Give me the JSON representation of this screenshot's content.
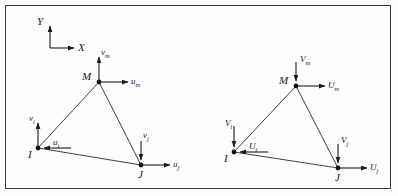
{
  "figure": {
    "border_color": "#3a3a3a",
    "line_color": "#1a1a1a",
    "background": "#fdfdfc"
  },
  "axes": {
    "x_label": "X",
    "y_label": "Y",
    "x_direction": "right",
    "y_direction": "up",
    "origin": [
      50,
      48
    ]
  },
  "elements": [
    {
      "name": "left-element",
      "coordinate_system": "local",
      "nodes": [
        {
          "id": "I",
          "label": "I",
          "x": 38,
          "y": 148
        },
        {
          "id": "J",
          "label": "J",
          "x": 141,
          "y": 165
        },
        {
          "id": "M",
          "label": "M",
          "x": 99,
          "y": 82
        }
      ],
      "vectors": [
        {
          "node": "I",
          "label": "v",
          "subscript": "i",
          "axis": "vertical",
          "direction": "up"
        },
        {
          "node": "I",
          "label": "u",
          "subscript": "i",
          "axis": "horizontal",
          "direction": "left"
        },
        {
          "node": "J",
          "label": "v",
          "subscript": "j",
          "axis": "vertical",
          "direction": "down"
        },
        {
          "node": "J",
          "label": "u",
          "subscript": "j",
          "axis": "horizontal",
          "direction": "right"
        },
        {
          "node": "M",
          "label": "v",
          "subscript": "m",
          "axis": "vertical",
          "direction": "up"
        },
        {
          "node": "M",
          "label": "u",
          "subscript": "m",
          "axis": "horizontal",
          "direction": "right"
        }
      ]
    },
    {
      "name": "right-element",
      "coordinate_system": "global",
      "nodes": [
        {
          "id": "I",
          "label": "I",
          "x": 234,
          "y": 152
        },
        {
          "id": "J",
          "label": "J",
          "x": 338,
          "y": 168
        },
        {
          "id": "M",
          "label": "M",
          "x": 296,
          "y": 86
        }
      ],
      "vectors": [
        {
          "node": "I",
          "label": "V",
          "subscript": "i",
          "axis": "vertical",
          "direction": "down"
        },
        {
          "node": "I",
          "label": "U",
          "subscript": "i",
          "axis": "horizontal",
          "direction": "left"
        },
        {
          "node": "J",
          "label": "V",
          "subscript": "j",
          "axis": "vertical",
          "direction": "down"
        },
        {
          "node": "J",
          "label": "U",
          "subscript": "j",
          "axis": "horizontal",
          "direction": "right"
        },
        {
          "node": "M",
          "label": "V",
          "subscript": "m",
          "axis": "vertical",
          "direction": "down"
        },
        {
          "node": "M",
          "label": "U",
          "subscript": "m",
          "axis": "horizontal",
          "direction": "right"
        }
      ]
    }
  ],
  "labels": {
    "axis_x": "X",
    "axis_y": "Y",
    "l_node_i": "I",
    "l_node_j": "J",
    "l_node_m": "M",
    "l_vi": "v",
    "l_vi_sub": "i",
    "l_ui": "u",
    "l_ui_sub": "i",
    "l_vj": "v",
    "l_vj_sub": "j",
    "l_uj": "u",
    "l_uj_sub": "j",
    "l_vm": "v",
    "l_vm_sub": "m",
    "l_um": "u",
    "l_um_sub": "m",
    "r_node_i": "I",
    "r_node_j": "J",
    "r_node_m": "M",
    "r_vi": "V",
    "r_vi_sub": "i",
    "r_ui": "U",
    "r_ui_sub": "i",
    "r_vj": "V",
    "r_vj_sub": "j",
    "r_uj": "U",
    "r_uj_sub": "j",
    "r_vm": "V",
    "r_vm_sub": "m",
    "r_um": "U",
    "r_um_sub": "m"
  }
}
